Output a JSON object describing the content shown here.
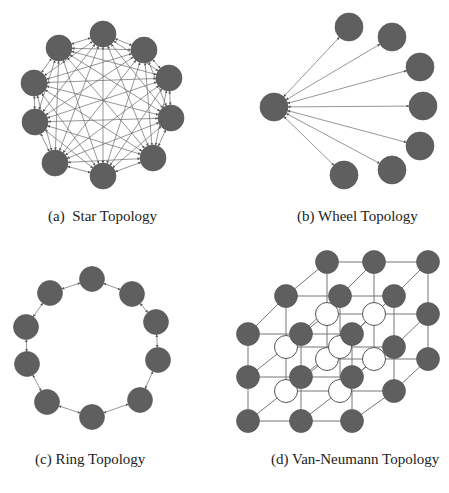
{
  "colors": {
    "node_fill": "#5f5f5f",
    "node_stroke": "#505050",
    "hollow_fill": "#ffffff",
    "hollow_stroke": "#555555",
    "edge": "#6a6a6a",
    "background": "#ffffff"
  },
  "panels": [
    {
      "id": "star",
      "caption": "(a)  Star Topology",
      "caption_pos": [
        48,
        208
      ],
      "type": "complete",
      "node_radius": 13,
      "nodes": [
        [
          103,
          34
        ],
        [
          144,
          50
        ],
        [
          169,
          78
        ],
        [
          171,
          118
        ],
        [
          153,
          158
        ],
        [
          103,
          176
        ],
        [
          55,
          163
        ],
        [
          35,
          122
        ],
        [
          34,
          83
        ],
        [
          59,
          48
        ]
      ]
    },
    {
      "id": "wheel",
      "caption": "(b) Wheel Topology",
      "caption_pos": [
        297,
        208
      ],
      "type": "hub",
      "node_radius": 14,
      "hub": [
        274,
        107
      ],
      "nodes": [
        [
          349,
          27
        ],
        [
          392,
          37
        ],
        [
          420,
          67
        ],
        [
          423,
          106
        ],
        [
          420,
          146
        ],
        [
          392,
          170
        ],
        [
          344,
          175
        ]
      ]
    },
    {
      "id": "ring",
      "caption": "(c) Ring Topology",
      "caption_pos": [
        35,
        451
      ],
      "type": "ring",
      "node_radius": 12.5,
      "nodes": [
        [
          92,
          279
        ],
        [
          132,
          294
        ],
        [
          156,
          322
        ],
        [
          158,
          360
        ],
        [
          140,
          400
        ],
        [
          92,
          417
        ],
        [
          47,
          402
        ],
        [
          27,
          364
        ],
        [
          26,
          327
        ],
        [
          50,
          293
        ]
      ]
    },
    {
      "id": "vonneumann",
      "caption": "(d) Van-Neumann Topology",
      "caption_pos": [
        271,
        451
      ],
      "type": "lattice",
      "node_radius": 11.5,
      "layers": [
        {
          "k": 0,
          "xs": [
            248,
            301,
            352
          ],
          "ys": [
            421,
            377,
            334
          ],
          "hollow": [
            [
              0,
              0,
              0
            ],
            [
              0,
              0,
              0
            ],
            [
              0,
              0,
              0
            ]
          ]
        },
        {
          "k": 1,
          "xs": [
            286,
            340,
            394
          ],
          "ys": [
            391,
            347,
            296
          ],
          "hollow": [
            [
              1,
              1,
              0
            ],
            [
              1,
              1,
              0
            ],
            [
              0,
              0,
              0
            ]
          ]
        },
        {
          "k": 2,
          "xs": [
            327,
            374,
            428
          ],
          "ys": [
            359,
            314,
            262
          ],
          "hollow": [
            [
              1,
              1,
              0
            ],
            [
              1,
              1,
              0
            ],
            [
              0,
              0,
              0
            ]
          ]
        }
      ]
    }
  ]
}
